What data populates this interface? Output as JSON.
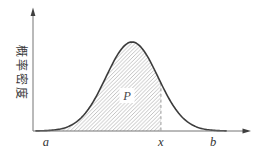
{
  "figure": {
    "background": "#ffffff"
  },
  "chart_data": {
    "type": "area",
    "title": "",
    "xlabel": "",
    "ylabel": "概率密度",
    "x_tick_labels": [
      "a",
      "x",
      "b"
    ],
    "x_tick_fracs": [
      0.06,
      0.595,
      0.837
    ],
    "axis_arrows": true,
    "grid": false,
    "curve": {
      "shape": "gaussian",
      "mu_frac": 0.4605,
      "sigma_frac": 0.121,
      "height_frac": 0.774,
      "draw_from_frac": 0.014,
      "draw_to_frac": 0.898
    },
    "shaded_region": {
      "label": "P",
      "from_frac": 0.0326,
      "to_frac": 0.595,
      "hatch": "diagonal-forward"
    },
    "annotations": [
      {
        "text": "P",
        "x_frac": 0.437,
        "y_frac": 0.27
      }
    ],
    "colors": {
      "curve": "#3c3c3c",
      "axis": "#757575",
      "hatch": "#a8a8a8",
      "dashed_line": "#9a9a9a",
      "label_text": "#333333"
    }
  }
}
